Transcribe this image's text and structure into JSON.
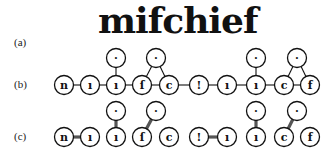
{
  "panels": {
    "a": {
      "label": "(a)",
      "word": "mifchief"
    },
    "b": {
      "label": "(b)"
    },
    "c": {
      "label": "(c)"
    }
  },
  "diagram": {
    "base_nodes": [
      {
        "id": "n1",
        "glyph": "n",
        "x": 64
      },
      {
        "id": "n2",
        "glyph": "ı",
        "x": 90
      },
      {
        "id": "n3",
        "glyph": "ı",
        "x": 116
      },
      {
        "id": "n4",
        "glyph": "ſ",
        "x": 142
      },
      {
        "id": "n5",
        "glyph": "c",
        "x": 169
      },
      {
        "id": "n6",
        "glyph": "!",
        "x": 199
      },
      {
        "id": "n7",
        "glyph": "ı",
        "x": 227
      },
      {
        "id": "n8",
        "glyph": "ı",
        "x": 256
      },
      {
        "id": "n9",
        "glyph": "c",
        "x": 284
      },
      {
        "id": "n10",
        "glyph": "f",
        "x": 310
      }
    ],
    "upper_nodes": [
      {
        "id": "u1",
        "glyph": "·",
        "x": 116
      },
      {
        "id": "u2",
        "glyph": "·",
        "x": 156
      },
      {
        "id": "u3",
        "glyph": "·",
        "x": 256
      },
      {
        "id": "u4",
        "glyph": "·",
        "x": 297
      }
    ],
    "row_b": {
      "base_y": 85,
      "upper_y": 58,
      "chain_edges": [
        [
          "n1",
          "n2"
        ],
        [
          "n2",
          "n3"
        ],
        [
          "n3",
          "n4"
        ],
        [
          "n4",
          "n5"
        ],
        [
          "n5",
          "n6"
        ],
        [
          "n6",
          "n7"
        ],
        [
          "n7",
          "n8"
        ],
        [
          "n8",
          "n9"
        ],
        [
          "n9",
          "n10"
        ]
      ],
      "upper_edges": [
        [
          "u1",
          "n3"
        ],
        [
          "u2",
          "n4"
        ],
        [
          "u2",
          "n5"
        ],
        [
          "u3",
          "n8"
        ],
        [
          "u4",
          "n9"
        ],
        [
          "u4",
          "n10"
        ]
      ]
    },
    "row_c": {
      "base_y": 137,
      "upper_y": 111,
      "chain_edges": [
        [
          "n1",
          "n2"
        ],
        [
          "n6",
          "n7"
        ]
      ],
      "upper_edges": [
        [
          "u1",
          "n3"
        ],
        [
          "u2",
          "n4"
        ],
        [
          "u3",
          "n8"
        ],
        [
          "u4",
          "n9"
        ]
      ]
    }
  }
}
